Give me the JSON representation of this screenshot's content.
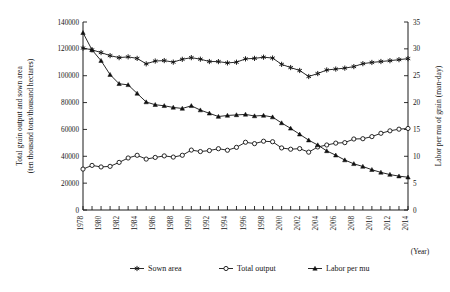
{
  "chart_data": {
    "type": "line",
    "title": "",
    "xlabel": "(Year)",
    "ylabel": "Total grain output and sown area (ten thousand tons/thousand hectares)",
    "y2label": "Labor per mu of grain (man-day)",
    "grid": false,
    "legend_position": "bottom",
    "xlim": [
      1978,
      2014
    ],
    "ylim": [
      0,
      140000
    ],
    "y2lim": [
      0,
      35
    ],
    "x": [
      1978,
      1979,
      1980,
      1981,
      1982,
      1983,
      1984,
      1985,
      1986,
      1987,
      1988,
      1989,
      1990,
      1991,
      1992,
      1993,
      1994,
      1995,
      1996,
      1997,
      1998,
      1999,
      2000,
      2001,
      2002,
      2003,
      2004,
      2005,
      2006,
      2007,
      2008,
      2009,
      2010,
      2011,
      2012,
      2013,
      2014
    ],
    "x_tick_labels": [
      "1978",
      "1980",
      "1982",
      "1984",
      "1986",
      "1988",
      "1990",
      "1992",
      "1994",
      "1996",
      "1998",
      "2000",
      "2002",
      "2004",
      "2006",
      "2008",
      "2010",
      "2012",
      "2014"
    ],
    "y_tick_labels": [
      "0",
      "20000",
      "40000",
      "60000",
      "80000",
      "100000",
      "120000",
      "140000"
    ],
    "y2_tick_labels": [
      "0",
      "5",
      "10",
      "15",
      "20",
      "25",
      "30",
      "35"
    ],
    "series": [
      {
        "name": "Sown area",
        "axis": "left",
        "marker": "star",
        "values": [
          120587,
          119263,
          117234,
          114958,
          113463,
          114047,
          112884,
          108845,
          110933,
          111268,
          110123,
          112205,
          113466,
          112314,
          110560,
          110509,
          109544,
          110060,
          112548,
          112912,
          113787,
          113161,
          108463,
          106080,
          103891,
          99410,
          101606,
          104278,
          104958,
          105638,
          106793,
          108986,
          109876,
          110573,
          111205,
          111956,
          112738
        ]
      },
      {
        "name": "Total output",
        "axis": "left",
        "marker": "circle",
        "values": [
          30477,
          33212,
          32056,
          32502,
          35450,
          38728,
          40731,
          37911,
          39151,
          40298,
          39408,
          40755,
          44624,
          43529,
          44266,
          45649,
          44510,
          46662,
          50454,
          49417,
          51230,
          50839,
          46218,
          45264,
          45706,
          43070,
          46947,
          48402,
          49804,
          50160,
          52871,
          53082,
          54648,
          57121,
          58958,
          60194,
          60703
        ]
      },
      {
        "name": "Labor per mu",
        "axis": "right",
        "marker": "triangle",
        "values": [
          33.0,
          29.8,
          27.8,
          25.2,
          23.5,
          23.3,
          21.7,
          20.1,
          19.6,
          19.4,
          19.1,
          18.9,
          19.4,
          18.6,
          18.0,
          17.4,
          17.6,
          17.7,
          17.8,
          17.5,
          17.6,
          17.3,
          16.2,
          15.2,
          14.1,
          13.0,
          12.1,
          11.0,
          10.2,
          9.3,
          8.6,
          8.1,
          7.5,
          7.0,
          6.6,
          6.3,
          6.1
        ]
      }
    ]
  },
  "legend": {
    "items": [
      {
        "label": "Sown area"
      },
      {
        "label": "Total output"
      },
      {
        "label": "Labor per mu"
      }
    ]
  },
  "axes": {
    "x_unit": "(Year)",
    "left_title_line1": "Total grain output and sown area",
    "left_title_line2": "(ten thousand tons/thousand hectares)",
    "right_title": "Labor per mu of grain (man-day)"
  },
  "colors": {
    "ink": "#111111",
    "background": "#ffffff"
  }
}
